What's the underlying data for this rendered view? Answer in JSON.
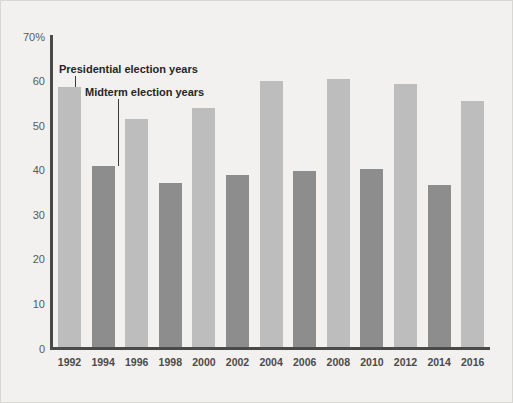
{
  "chart_data": {
    "type": "bar",
    "title": "",
    "subtitle": "",
    "xlabel": "",
    "ylabel": "",
    "ylim": [
      0,
      70
    ],
    "grid": false,
    "legend_position": "inline-annotation",
    "categories": [
      "1992",
      "1994",
      "1996",
      "1998",
      "2000",
      "2002",
      "2004",
      "2006",
      "2008",
      "2010",
      "2012",
      "2014",
      "2016"
    ],
    "values": [
      58.4,
      40.7,
      51.1,
      36.9,
      53.6,
      38.7,
      59.6,
      39.6,
      60.2,
      40.0,
      59.1,
      36.4,
      55.1
    ],
    "bar_types": [
      "presidential",
      "midterm",
      "presidential",
      "midterm",
      "presidential",
      "midterm",
      "presidential",
      "midterm",
      "presidential",
      "midterm",
      "presidential",
      "midterm",
      "presidential"
    ],
    "y_ticks": [
      "70%",
      "60",
      "50",
      "40",
      "30",
      "20",
      "10",
      "0"
    ],
    "y_tick_values": [
      70,
      60,
      50,
      40,
      30,
      20,
      10,
      0
    ],
    "annotations": [
      {
        "text": "Presidential election years",
        "target_category": "1992"
      },
      {
        "text": "Midterm election years",
        "target_category": "1994"
      }
    ],
    "colors": {
      "presidential": "#bdbdbd",
      "midterm": "#8d8d8d",
      "axis": "#4a4a4a",
      "background": "#f2f1ef",
      "tick_text": "#5a5a5a",
      "annotation_text": "#262626"
    }
  }
}
